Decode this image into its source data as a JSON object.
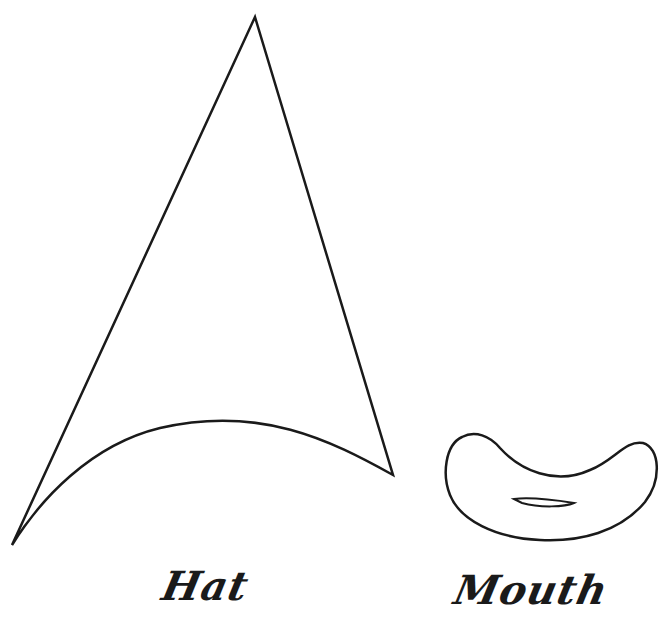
{
  "figure": {
    "stroke_color": "#1a1a1a",
    "background": "#ffffff",
    "shapes": [
      {
        "name": "hat",
        "label": "Hat"
      },
      {
        "name": "mouth",
        "label": "Mouth"
      }
    ]
  }
}
